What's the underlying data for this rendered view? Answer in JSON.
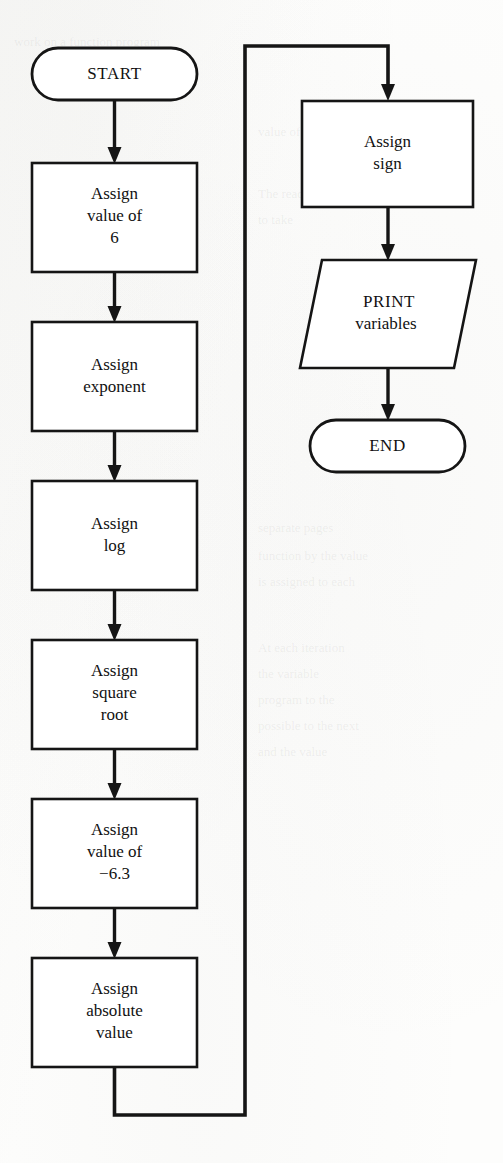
{
  "figure": {
    "kind": "flowchart",
    "orientation": "two-column, top-to-bottom with loop connector",
    "ink_color": "#151515",
    "paper_color": "#fdfdfc"
  },
  "nodes": [
    {
      "id": "start",
      "shape": "terminator",
      "column": "left",
      "lines": [
        "START"
      ],
      "x": 32,
      "y": 48,
      "w": 165,
      "h": 52
    },
    {
      "id": "assign-value-6",
      "shape": "process",
      "column": "left",
      "lines": [
        "Assign",
        "value of",
        "6"
      ],
      "x": 32,
      "y": 163,
      "w": 165,
      "h": 109
    },
    {
      "id": "assign-exponent",
      "shape": "process",
      "column": "left",
      "lines": [
        "Assign",
        "exponent"
      ],
      "x": 32,
      "y": 322,
      "w": 165,
      "h": 109
    },
    {
      "id": "assign-log",
      "shape": "process",
      "column": "left",
      "lines": [
        "Assign",
        "log"
      ],
      "x": 32,
      "y": 481,
      "w": 165,
      "h": 109
    },
    {
      "id": "assign-square-root",
      "shape": "process",
      "column": "left",
      "lines": [
        "Assign",
        "square",
        "root"
      ],
      "x": 32,
      "y": 640,
      "w": 165,
      "h": 109
    },
    {
      "id": "assign-value-neg63",
      "shape": "process",
      "column": "left",
      "lines": [
        "Assign",
        "value of",
        "−6.3"
      ],
      "x": 32,
      "y": 799,
      "w": 165,
      "h": 109
    },
    {
      "id": "assign-absolute-value",
      "shape": "process",
      "column": "left",
      "lines": [
        "Assign",
        "absolute",
        "value"
      ],
      "x": 32,
      "y": 958,
      "w": 165,
      "h": 109
    },
    {
      "id": "assign-sign",
      "shape": "process",
      "column": "right",
      "lines": [
        "Assign",
        "sign"
      ],
      "x": 302,
      "y": 101,
      "w": 171,
      "h": 106
    },
    {
      "id": "print-variables",
      "shape": "parallelogram",
      "column": "right",
      "lines": [
        "PRINT",
        "variables"
      ],
      "x": 300,
      "y": 260,
      "w": 176,
      "h": 108
    },
    {
      "id": "end",
      "shape": "terminator",
      "column": "right",
      "lines": [
        "END"
      ],
      "x": 310,
      "y": 420,
      "w": 155,
      "h": 52
    }
  ],
  "connectors": [
    {
      "id": "start-to-value6",
      "from": "start",
      "to": "assign-value-6",
      "type": "vertical-arrow"
    },
    {
      "id": "value6-to-exponent",
      "from": "assign-value-6",
      "to": "assign-exponent",
      "type": "vertical-arrow"
    },
    {
      "id": "exponent-to-log",
      "from": "assign-exponent",
      "to": "assign-log",
      "type": "vertical-arrow"
    },
    {
      "id": "log-to-squareroot",
      "from": "assign-log",
      "to": "assign-square-root",
      "type": "vertical-arrow"
    },
    {
      "id": "squareroot-to-value63",
      "from": "assign-square-root",
      "to": "assign-value-neg63",
      "type": "vertical-arrow"
    },
    {
      "id": "value63-to-absolute",
      "from": "assign-value-neg63",
      "to": "assign-absolute-value",
      "type": "vertical-arrow"
    },
    {
      "id": "absolute-to-sign-loop",
      "from": "assign-absolute-value",
      "to": "assign-sign",
      "type": "loop-back-arrow"
    },
    {
      "id": "sign-to-print",
      "from": "assign-sign",
      "to": "print-variables",
      "type": "vertical-arrow"
    },
    {
      "id": "print-to-end",
      "from": "print-variables",
      "to": "end",
      "type": "vertical-arrow"
    }
  ],
  "ghost_text": [
    {
      "text": "work on a function program",
      "x": 14,
      "y": 34
    },
    {
      "text": "value of the variable",
      "x": 258,
      "y": 124
    },
    {
      "text": "The reader designed",
      "x": 258,
      "y": 186
    },
    {
      "text": "to take",
      "x": 258,
      "y": 212
    },
    {
      "text": "separate pages",
      "x": 258,
      "y": 520
    },
    {
      "text": "function by the value",
      "x": 258,
      "y": 548
    },
    {
      "text": "is assigned to each",
      "x": 258,
      "y": 574
    },
    {
      "text": "At each iteration",
      "x": 258,
      "y": 640
    },
    {
      "text": "the variable",
      "x": 258,
      "y": 666
    },
    {
      "text": "program to the",
      "x": 258,
      "y": 692
    },
    {
      "text": "possible to the next",
      "x": 258,
      "y": 718
    },
    {
      "text": "and the value",
      "x": 258,
      "y": 744
    }
  ]
}
